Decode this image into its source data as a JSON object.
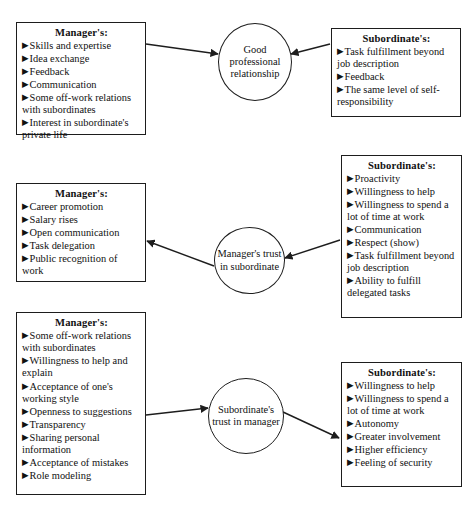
{
  "diagram": {
    "ink_color": "#1d1d1d",
    "background": "#ffffff"
  },
  "nodes": {
    "top_left_box": {
      "heading": "Manager's:",
      "items": [
        "Skills and expertise",
        "Idea exchange",
        "Feedback",
        "Communication",
        "Some off-work relations with subordinates",
        "Interest in subordinate's private life"
      ]
    },
    "top_right_box": {
      "heading": "Subordinate's:",
      "items": [
        "Task fulfillment beyond job description",
        "Feedback",
        "The same level of self-responsibility"
      ]
    },
    "top_ellipse": {
      "label": "Good professional relationship"
    },
    "middle_left_box": {
      "heading": "Manager's:",
      "items": [
        "Career promotion",
        "Salary rises",
        "Open communication",
        "Task delegation",
        "Public recognition of work"
      ]
    },
    "middle_right_box": {
      "heading": "Subordinate's:",
      "items": [
        "Proactivity",
        "Willingness to help",
        "Willingness to spend a lot of time at work",
        "Communication",
        "Respect (show)",
        "Task fulfillment beyond job description",
        "Ability to fulfill delegated tasks"
      ]
    },
    "middle_ellipse": {
      "label": "Manager's trust in subordinate"
    },
    "bottom_left_box": {
      "heading": "Manager's:",
      "items": [
        "Some off-work relations with subordinates",
        "Willingness to help and explain",
        "Acceptance of one's working style",
        "Openness to suggestions",
        "Transparency",
        "Sharing personal information",
        "Acceptance of mistakes",
        "Role modeling"
      ]
    },
    "bottom_right_box": {
      "heading": "Subordinate's:",
      "items": [
        "Willingness to help",
        "Willingness to spend a lot of time at work",
        "Autonomy",
        "Greater involvement",
        "Higher efficiency",
        "Feeling of security"
      ]
    },
    "bottom_ellipse": {
      "label": "Subordinate's trust in manager"
    }
  },
  "edges": [
    {
      "name": "top-left-box-to-good-relationship",
      "from": "top_left_box",
      "to": "top_ellipse",
      "direction": "right"
    },
    {
      "name": "top-right-box-to-good-relationship",
      "from": "top_right_box",
      "to": "top_ellipse",
      "direction": "left"
    },
    {
      "name": "middle-right-box-to-manager-trust",
      "from": "middle_right_box",
      "to": "middle_ellipse",
      "direction": "left"
    },
    {
      "name": "manager-trust-to-middle-left-box",
      "from": "middle_ellipse",
      "to": "middle_left_box",
      "direction": "left"
    },
    {
      "name": "bottom-left-box-to-subordinate-trust",
      "from": "bottom_left_box",
      "to": "bottom_ellipse",
      "direction": "right"
    },
    {
      "name": "subordinate-trust-to-bottom-right-box",
      "from": "bottom_ellipse",
      "to": "bottom_right_box",
      "direction": "right"
    }
  ],
  "bullet_glyph": "▶"
}
